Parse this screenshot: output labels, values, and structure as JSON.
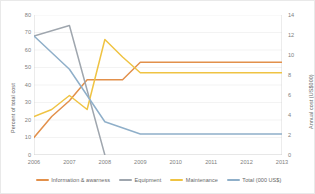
{
  "chart_data": {
    "type": "line",
    "title": "",
    "xlabel": "",
    "ylabel": "Percent of total cost",
    "ylabel_secondary": "Annual cost (US$000)",
    "categories": [
      "2006",
      "2007",
      "2008",
      "2009",
      "2010",
      "2011",
      "2012",
      "2013"
    ],
    "x_tick_labels": [
      "2006",
      "2007",
      "2008",
      "2009",
      "2010",
      "2011",
      "2012",
      "2013"
    ],
    "y_tick_labels": [
      "0",
      "10",
      "20",
      "30",
      "40",
      "50",
      "60",
      "70",
      "80"
    ],
    "y_tick_values": [
      0,
      10,
      20,
      30,
      40,
      50,
      60,
      70,
      80
    ],
    "ylim": [
      0,
      80
    ],
    "y2_tick_labels": [
      "0",
      "2",
      "4",
      "6",
      "8",
      "10",
      "12",
      "14"
    ],
    "y2_tick_values": [
      0,
      2,
      4,
      6,
      8,
      10,
      12,
      14
    ],
    "ylim_secondary": [
      0,
      14
    ],
    "grid": true,
    "legend_position": "bottom",
    "series": [
      {
        "name": "Information & awarness",
        "color": "#E2904B",
        "axis": "left",
        "x": [
          2006,
          2006.5,
          2007,
          2007.5,
          2008,
          2008.5,
          2009,
          2010,
          2011,
          2012,
          2013
        ],
        "values": [
          10,
          22,
          31,
          43,
          43,
          43,
          53,
          53,
          53,
          53,
          53
        ]
      },
      {
        "name": "Equipment",
        "color": "#9FA6AE",
        "axis": "left",
        "x": [
          2006,
          2007,
          2008
        ],
        "values": [
          68,
          74,
          0
        ]
      },
      {
        "name": "Maintenance",
        "color": "#EFC343",
        "axis": "left",
        "x": [
          2006,
          2006.5,
          2007,
          2007.5,
          2008,
          2008.5,
          2009,
          2010,
          2011,
          2012,
          2013
        ],
        "values": [
          22,
          26,
          34,
          26,
          66,
          56,
          47,
          47,
          47,
          47,
          47
        ]
      },
      {
        "name": "Total (000 US$)",
        "color": "#8FAFC9",
        "axis": "right",
        "x": [
          2006,
          2007,
          2008,
          2009,
          2010,
          2011,
          2012,
          2013
        ],
        "values": [
          11.9,
          8.6,
          3.3,
          2.1,
          2.1,
          2.1,
          2.1,
          2.1
        ],
        "values_as_percent_scale": [
          68,
          49,
          19,
          12,
          12,
          12,
          12,
          12
        ]
      }
    ],
    "legend": [
      {
        "label": "Information & awarness",
        "color": "#E2904B"
      },
      {
        "label": "Equipment",
        "color": "#9FA6AE"
      },
      {
        "label": "Maintenance",
        "color": "#EFC343"
      },
      {
        "label": "Total (000 US$)",
        "color": "#8FAFC9"
      }
    ]
  }
}
